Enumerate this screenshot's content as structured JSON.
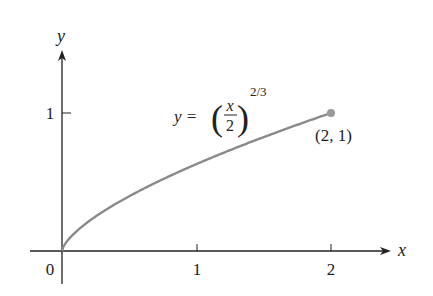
{
  "chart_data": {
    "type": "line",
    "title": "",
    "xlabel": "x",
    "ylabel": "y",
    "x_ticks": [
      "0",
      "1",
      "2"
    ],
    "y_ticks": [
      "1"
    ],
    "series": [
      {
        "name": "y = (x/2)^(2/3)",
        "function": "(x/2)^(2/3)",
        "x": [
          0,
          0.25,
          0.5,
          0.75,
          1,
          1.25,
          1.5,
          1.75,
          2
        ],
        "values": [
          0,
          0.25,
          0.397,
          0.52,
          0.63,
          0.731,
          0.825,
          0.915,
          1
        ]
      }
    ],
    "annotations": [
      {
        "text": "y = (x/2)^(2/3)",
        "position": "above curve"
      },
      {
        "text": "(2, 1)",
        "point": [
          2,
          1
        ]
      }
    ],
    "xlim": [
      -0.2,
      2.3
    ],
    "ylim": [
      -0.4,
      1.7
    ],
    "grid": false,
    "colors": {
      "curve": "#8a8a8a",
      "axes": "#222222",
      "point": "#999999"
    }
  },
  "labels": {
    "origin": "0",
    "x_tick_1": "1",
    "x_tick_2": "2",
    "y_tick_1": "1",
    "x_axis": "x",
    "y_axis": "y",
    "eq_lhs": "y =",
    "eq_num": "x",
    "eq_den": "2",
    "eq_exp": "2/3",
    "point_label": "(2, 1)"
  }
}
